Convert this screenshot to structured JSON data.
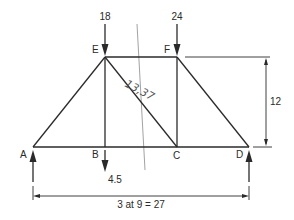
{
  "diagram": {
    "type": "truss",
    "nodes": {
      "A": {
        "label": "A"
      },
      "B": {
        "label": "B"
      },
      "C": {
        "label": "C"
      },
      "D": {
        "label": "D"
      },
      "E": {
        "label": "E"
      },
      "F": {
        "label": "F"
      }
    },
    "members": [
      "A-B",
      "B-C",
      "C-D",
      "E-F",
      "A-E",
      "B-E",
      "E-C",
      "C-F",
      "F-D"
    ],
    "loads": [
      {
        "node": "E",
        "value": "18",
        "direction": "down"
      },
      {
        "node": "F",
        "value": "24",
        "direction": "down"
      },
      {
        "node": "B",
        "value": "4.5",
        "direction": "down"
      }
    ],
    "reactions": [
      {
        "node": "A",
        "direction": "up"
      },
      {
        "node": "D",
        "direction": "up"
      }
    ],
    "dimensions": {
      "height": "12",
      "span": "3 at 9 = 27"
    },
    "annotation": {
      "handwritten": "13,37"
    },
    "colors": {
      "line": "#2a2a2a",
      "pencil": "#8a8a8a"
    }
  }
}
